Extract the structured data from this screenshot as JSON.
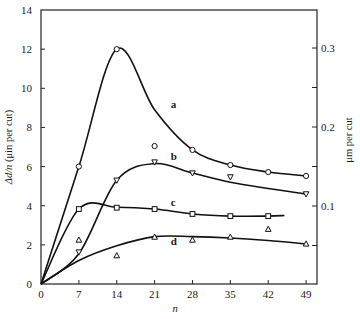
{
  "chart_data": {
    "type": "line",
    "title": "",
    "xlabel": "n",
    "ylabel": "Δd/n (μin per cut)",
    "ylabel_italic_part": "Δd/n",
    "ylabel_unit_part": " (μin per cut)",
    "y2label": "μm per cut",
    "xlim": [
      0,
      51
    ],
    "ylim": [
      0,
      14
    ],
    "y2lim": [
      0,
      0.355
    ],
    "x_ticks": [
      0,
      7,
      14,
      21,
      28,
      35,
      42,
      49
    ],
    "y_ticks": [
      0,
      2,
      4,
      6,
      8,
      10,
      12,
      14
    ],
    "y2_ticks": [
      0.1,
      0.2,
      0.3
    ],
    "y2_minor_ticks": [
      0.05,
      0.15,
      0.25
    ],
    "grid": false,
    "legend": "inline curve labels",
    "series": [
      {
        "name": "a",
        "marker": "circle",
        "points": [
          [
            7,
            6.0
          ],
          [
            14,
            12.0
          ],
          [
            21,
            7.05
          ],
          [
            28,
            6.85
          ],
          [
            35,
            6.08
          ],
          [
            42,
            5.72
          ],
          [
            49,
            5.52
          ]
        ],
        "curve": [
          [
            0,
            0
          ],
          [
            7,
            6.0
          ],
          [
            14,
            12.0
          ],
          [
            21,
            8.9
          ],
          [
            28,
            6.85
          ],
          [
            35,
            6.08
          ],
          [
            42,
            5.72
          ],
          [
            49,
            5.52
          ]
        ],
        "label_pos": [
          24,
          9.0
        ]
      },
      {
        "name": "b",
        "marker": "inverted-triangle",
        "points": [
          [
            7,
            1.63
          ],
          [
            14,
            5.3
          ],
          [
            21,
            6.23
          ],
          [
            28,
            5.67
          ],
          [
            35,
            5.47
          ],
          [
            49,
            4.6
          ]
        ],
        "curve": [
          [
            0,
            0
          ],
          [
            7,
            1.55
          ],
          [
            14,
            5.3
          ],
          [
            21,
            6.15
          ],
          [
            28,
            5.67
          ],
          [
            35,
            5.2
          ],
          [
            42,
            4.88
          ],
          [
            49,
            4.6
          ]
        ],
        "label_pos": [
          24,
          6.35
        ]
      },
      {
        "name": "c",
        "marker": "square",
        "points": [
          [
            7,
            3.83
          ],
          [
            14,
            3.9
          ],
          [
            21,
            3.83
          ],
          [
            28,
            3.58
          ],
          [
            35,
            3.47
          ],
          [
            42,
            3.47
          ]
        ],
        "curve": [
          [
            0,
            0
          ],
          [
            7,
            3.83
          ],
          [
            14,
            3.92
          ],
          [
            21,
            3.83
          ],
          [
            28,
            3.58
          ],
          [
            35,
            3.47
          ],
          [
            42,
            3.47
          ],
          [
            45,
            3.5
          ]
        ],
        "label_pos": [
          24,
          4.0
        ]
      },
      {
        "name": "d",
        "marker": "triangle",
        "points": [
          [
            7,
            2.25
          ],
          [
            14,
            1.45
          ],
          [
            21,
            2.4
          ],
          [
            28,
            2.25
          ],
          [
            35,
            2.4
          ],
          [
            42,
            2.8
          ],
          [
            49,
            2.05
          ]
        ],
        "curve": [
          [
            0,
            0
          ],
          [
            7,
            1.2
          ],
          [
            14,
            1.95
          ],
          [
            21,
            2.42
          ],
          [
            28,
            2.42
          ],
          [
            35,
            2.35
          ],
          [
            42,
            2.22
          ],
          [
            49,
            2.05
          ]
        ],
        "label_pos": [
          24,
          2.0
        ]
      }
    ]
  }
}
